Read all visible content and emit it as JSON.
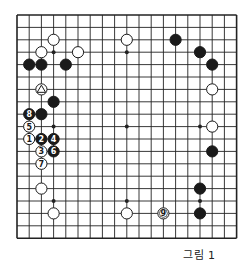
{
  "caption": "그림 1",
  "board": {
    "size": 19,
    "origin": [
      17,
      15
    ],
    "spacing": [
      12.2,
      12.4
    ],
    "star_points": [
      [
        3,
        3
      ],
      [
        9,
        3
      ],
      [
        15,
        3
      ],
      [
        3,
        9
      ],
      [
        9,
        9
      ],
      [
        15,
        9
      ],
      [
        3,
        15
      ],
      [
        9,
        15
      ],
      [
        15,
        15
      ]
    ],
    "stones": [
      {
        "c": 9,
        "r": 2,
        "color": "white"
      },
      {
        "c": 3,
        "r": 2,
        "color": "white"
      },
      {
        "c": 2,
        "r": 3,
        "color": "white"
      },
      {
        "c": 5,
        "r": 3,
        "color": "white"
      },
      {
        "c": 1,
        "r": 4,
        "color": "black"
      },
      {
        "c": 2,
        "r": 4,
        "color": "black"
      },
      {
        "c": 4,
        "r": 4,
        "color": "black"
      },
      {
        "c": 2,
        "r": 6,
        "color": "white",
        "mark": "triangle"
      },
      {
        "c": 3,
        "r": 7,
        "color": "black"
      },
      {
        "c": 1,
        "r": 8,
        "color": "black",
        "label": "8"
      },
      {
        "c": 2,
        "r": 8,
        "color": "black"
      },
      {
        "c": 1,
        "r": 9,
        "color": "white",
        "label": "5"
      },
      {
        "c": 1,
        "r": 10,
        "color": "white",
        "label": "1"
      },
      {
        "c": 2,
        "r": 10,
        "color": "black",
        "label": "2"
      },
      {
        "c": 3,
        "r": 10,
        "color": "black",
        "label": "4"
      },
      {
        "c": 2,
        "r": 11,
        "color": "white",
        "label": "3"
      },
      {
        "c": 3,
        "r": 11,
        "color": "black",
        "label": "6"
      },
      {
        "c": 2,
        "r": 12,
        "color": "white",
        "label": "7"
      },
      {
        "c": 2,
        "r": 14,
        "color": "white"
      },
      {
        "c": 3,
        "r": 16,
        "color": "white"
      },
      {
        "c": 9,
        "r": 16,
        "color": "white"
      },
      {
        "c": 12,
        "r": 16,
        "color": "white",
        "label": "9"
      },
      {
        "c": 13,
        "r": 2,
        "color": "black"
      },
      {
        "c": 15,
        "r": 3,
        "color": "black"
      },
      {
        "c": 16,
        "r": 4,
        "color": "black"
      },
      {
        "c": 16,
        "r": 6,
        "color": "white"
      },
      {
        "c": 16,
        "r": 9,
        "color": "white"
      },
      {
        "c": 16,
        "r": 11,
        "color": "black"
      },
      {
        "c": 15,
        "r": 14,
        "color": "black"
      },
      {
        "c": 15,
        "r": 16,
        "color": "black"
      }
    ]
  }
}
